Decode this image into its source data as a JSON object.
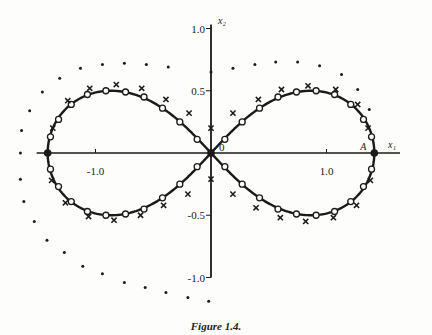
{
  "chart_data": {
    "type": "scatter",
    "title": "",
    "caption": "Figure 1.4.",
    "xlabel": "x₁",
    "ylabel": "x₂",
    "xlim": [
      -1.83,
      1.9
    ],
    "ylim": [
      -1.3,
      1.23
    ],
    "grid": false,
    "legend": "none",
    "x_ticks": [
      {
        "value": -1.0,
        "label": "-1.0"
      },
      {
        "value": 1.0,
        "label": "1.0"
      }
    ],
    "y_ticks": [
      {
        "value": 1.0,
        "label": "1.0"
      },
      {
        "value": 0.5,
        "label": "0.5"
      },
      {
        "value": -0.5,
        "label": "-0.5"
      },
      {
        "value": -1.0,
        "label": "-1.0"
      }
    ],
    "y_axis_range": [
      -1.0,
      1.0
    ],
    "annotations": [
      {
        "text": "0",
        "x": 0.0,
        "y": 0.0
      },
      {
        "text": "A",
        "x": 1.414,
        "y": 0.0
      }
    ],
    "series": [
      {
        "name": "lemniscate",
        "kind": "curve",
        "equation": "(x1^2 + x2^2)^2 = 2(x1^2 - x2^2)",
        "a": 1.414
      },
      {
        "name": "circles",
        "kind": "marker-circle",
        "points": [
          [
            1.39,
            0.13
          ],
          [
            1.32,
            0.27
          ],
          [
            1.21,
            0.39
          ],
          [
            1.07,
            0.47
          ],
          [
            0.91,
            0.5
          ],
          [
            0.74,
            0.49
          ],
          [
            0.58,
            0.45
          ],
          [
            0.42,
            0.36
          ],
          [
            0.27,
            0.25
          ],
          [
            0.12,
            0.11
          ],
          [
            -0.12,
            0.11
          ],
          [
            -0.27,
            0.25
          ],
          [
            -0.42,
            0.36
          ],
          [
            -0.58,
            0.45
          ],
          [
            -0.74,
            0.49
          ],
          [
            -0.91,
            0.5
          ],
          [
            -1.07,
            0.47
          ],
          [
            -1.21,
            0.39
          ],
          [
            -1.32,
            0.27
          ],
          [
            -1.39,
            0.13
          ],
          [
            1.39,
            -0.13
          ],
          [
            1.32,
            -0.27
          ],
          [
            1.21,
            -0.39
          ],
          [
            1.07,
            -0.47
          ],
          [
            0.91,
            -0.5
          ],
          [
            0.74,
            -0.49
          ],
          [
            0.58,
            -0.45
          ],
          [
            0.42,
            -0.36
          ],
          [
            0.27,
            -0.25
          ],
          [
            0.12,
            -0.11
          ],
          [
            -0.12,
            -0.11
          ],
          [
            -0.27,
            -0.25
          ],
          [
            -0.42,
            -0.36
          ],
          [
            -0.58,
            -0.45
          ],
          [
            -0.74,
            -0.49
          ],
          [
            -0.91,
            -0.5
          ],
          [
            -1.07,
            -0.47
          ],
          [
            -1.21,
            -0.39
          ],
          [
            -1.32,
            -0.27
          ],
          [
            -1.39,
            -0.13
          ]
        ]
      },
      {
        "name": "filled-points",
        "kind": "marker-filled",
        "points": [
          [
            -1.414,
            0.0
          ],
          [
            1.414,
            0.0
          ],
          [
            0.0,
            0.0
          ]
        ]
      },
      {
        "name": "crosses",
        "kind": "marker-cross",
        "points": [
          [
            -1.37,
            0.2
          ],
          [
            -1.24,
            0.42
          ],
          [
            -1.05,
            0.52
          ],
          [
            -0.82,
            0.55
          ],
          [
            -0.6,
            0.52
          ],
          [
            -0.39,
            0.43
          ],
          [
            -0.19,
            0.32
          ],
          [
            0.0,
            0.2
          ],
          [
            0.19,
            0.32
          ],
          [
            0.41,
            0.43
          ],
          [
            0.61,
            0.51
          ],
          [
            0.84,
            0.54
          ],
          [
            1.08,
            0.51
          ],
          [
            1.27,
            0.39
          ],
          [
            1.36,
            0.2
          ],
          [
            -1.38,
            -0.22
          ],
          [
            -1.26,
            -0.4
          ],
          [
            -1.06,
            -0.51
          ],
          [
            -0.84,
            -0.54
          ],
          [
            -0.61,
            -0.5
          ],
          [
            -0.41,
            -0.42
          ],
          [
            -0.2,
            -0.33
          ],
          [
            0.0,
            -0.21
          ],
          [
            0.19,
            -0.33
          ],
          [
            0.39,
            -0.44
          ],
          [
            0.6,
            -0.52
          ],
          [
            0.82,
            -0.55
          ],
          [
            1.06,
            -0.52
          ],
          [
            1.26,
            -0.42
          ],
          [
            1.38,
            -0.22
          ]
        ]
      },
      {
        "name": "dots",
        "kind": "marker-dot",
        "points": [
          [
            -1.65,
            0.0
          ],
          [
            -1.64,
            0.18
          ],
          [
            -1.57,
            0.34
          ],
          [
            -1.46,
            0.49
          ],
          [
            -1.31,
            0.6
          ],
          [
            -1.13,
            0.68
          ],
          [
            -0.94,
            0.71
          ],
          [
            -0.75,
            0.72
          ],
          [
            -0.56,
            0.71
          ],
          [
            -0.37,
            0.69
          ],
          [
            0.0,
            0.65
          ],
          [
            0.19,
            0.68
          ],
          [
            0.38,
            0.71
          ],
          [
            0.56,
            0.73
          ],
          [
            0.75,
            0.73
          ],
          [
            0.94,
            0.7
          ],
          [
            1.13,
            0.63
          ],
          [
            1.27,
            0.51
          ],
          [
            1.37,
            0.35
          ],
          [
            -1.65,
            -0.21
          ],
          [
            -1.62,
            -0.39
          ],
          [
            -1.53,
            -0.55
          ],
          [
            -1.42,
            -0.7
          ],
          [
            -1.27,
            -0.8
          ],
          [
            -1.11,
            -0.91
          ],
          [
            -0.94,
            -0.97
          ],
          [
            -0.75,
            -1.04
          ],
          [
            -0.57,
            -1.08
          ],
          [
            -0.39,
            -1.12
          ],
          [
            -0.2,
            -1.16
          ],
          [
            -0.02,
            -1.19
          ]
        ]
      }
    ]
  }
}
